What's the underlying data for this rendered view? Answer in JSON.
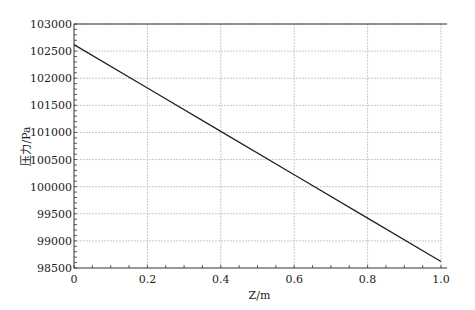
{
  "chart_data": {
    "type": "line",
    "title": "",
    "xlabel": "Z/m",
    "ylabel": "压力/Pa",
    "xlim": [
      0,
      1.0
    ],
    "ylim": [
      98500,
      103000
    ],
    "xticks": [
      0,
      0.2,
      0.4,
      0.6,
      0.8,
      1.0
    ],
    "xtick_labels": [
      "0",
      "0.2",
      "0.4",
      "0.6",
      "0.8",
      "1.0"
    ],
    "yticks": [
      98500,
      99000,
      99500,
      100000,
      100500,
      101000,
      101500,
      102000,
      102500,
      103000
    ],
    "ytick_labels": [
      "98500",
      "99000",
      "99500",
      "100000",
      "100500",
      "101000",
      "101500",
      "102000",
      "102500",
      "103000"
    ],
    "grid": true,
    "legend": null,
    "series": [
      {
        "name": "pressure",
        "color": "#222222",
        "x": [
          0,
          0.2,
          0.4,
          0.6,
          0.8,
          1.0
        ],
        "y": [
          102620,
          101820,
          101020,
          100220,
          99420,
          98620
        ]
      }
    ]
  },
  "layout": {
    "plot": {
      "left": 74,
      "top": 24,
      "right": 441,
      "bottom": 268
    },
    "colors": {
      "axis": "#333333",
      "grid": "#bbbbbb",
      "line": "#222222"
    }
  }
}
